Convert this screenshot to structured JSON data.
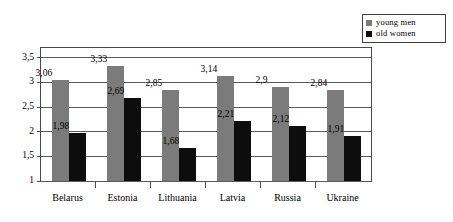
{
  "chart_data": {
    "type": "bar",
    "title": "",
    "subtitle": "",
    "xlabel": "",
    "ylabel": "",
    "categories": [
      "Belarus",
      "Estonia",
      "Lithuania",
      "Latvia",
      "Russia",
      "Ukraine"
    ],
    "series": [
      {
        "name": "young  men",
        "color": "#7b7b7b",
        "values": [
          3.06,
          3.33,
          2.85,
          3.14,
          2.9,
          2.84
        ],
        "labels": [
          "3,06",
          "3,33",
          "2,85",
          "3,14",
          "2,9",
          "2,84"
        ]
      },
      {
        "name": "old  women",
        "color": "#0d0d0d",
        "values": [
          1.98,
          2.69,
          1.68,
          2.21,
          2.12,
          1.91
        ],
        "labels": [
          "1,98",
          "2,69",
          "1,68",
          "2,21",
          "2,12",
          "1,91"
        ]
      }
    ],
    "ylim": [
      1,
      3.7
    ],
    "yticks": [
      1,
      1.5,
      2,
      2.5,
      3,
      3.5
    ],
    "ytick_labels": [
      "1",
      "1,5",
      "2",
      "2,5",
      "3",
      "3,5"
    ],
    "grid": true,
    "legend_position": "top-right",
    "decimal_separator": ","
  },
  "legend": {
    "items": [
      {
        "label": "young  men",
        "swatch": "#7b7b7b",
        "icon": "legend-square-gray"
      },
      {
        "label": "old  women",
        "swatch": "#0d0d0d",
        "icon": "legend-square-black"
      }
    ]
  }
}
